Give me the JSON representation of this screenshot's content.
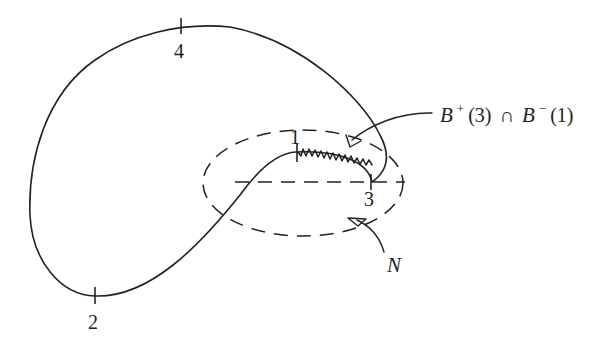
{
  "diagram": {
    "points": [
      {
        "id": "1",
        "label": "1"
      },
      {
        "id": "2",
        "label": "2"
      },
      {
        "id": "3",
        "label": "3"
      },
      {
        "id": "4",
        "label": "4"
      }
    ],
    "annotations": {
      "intersection": {
        "B1": "B",
        "sup1": "+",
        "arg1": "(3)",
        "cap": "∩",
        "B2": "B",
        "sup2": "−",
        "arg2": "(1)"
      },
      "neighborhood": "N"
    },
    "colors": {
      "ink": "#222222",
      "background": "#ffffff"
    }
  }
}
